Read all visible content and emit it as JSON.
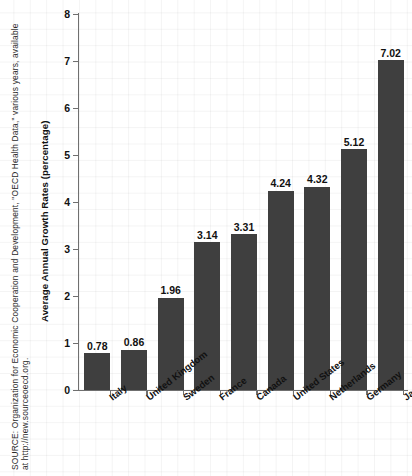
{
  "chart_data": {
    "type": "bar",
    "title": "",
    "xlabel": "",
    "ylabel": "Average Annual Growth Rates (percentage)",
    "ylim": [
      0,
      8
    ],
    "yticks": [
      0,
      1,
      2,
      3,
      4,
      5,
      6,
      7,
      8
    ],
    "grid": true,
    "legend": "none",
    "categories": [
      "Italy",
      "United Kingdom",
      "Sweden",
      "France",
      "Canada",
      "United States",
      "Netherlands",
      "Germany",
      "Japan"
    ],
    "values": [
      0.78,
      0.86,
      1.96,
      3.14,
      3.31,
      4.24,
      4.32,
      5.12,
      7.02
    ],
    "value_labels": [
      "0.78",
      "0.86",
      "1.96",
      "3.14",
      "3.31",
      "4.24",
      "4.32",
      "5.12",
      "7.02"
    ],
    "bar_color": "#3f3f3f",
    "axis_color": "#6f6f6f",
    "text_color": "#111111"
  },
  "source": {
    "line1": "SOURCE: Organization for Economic Cooperation and Development, \"OECD Health Data,\" various years, available",
    "line2": "at http://new.sourceoecd.org."
  },
  "bottom_partial_text": ""
}
